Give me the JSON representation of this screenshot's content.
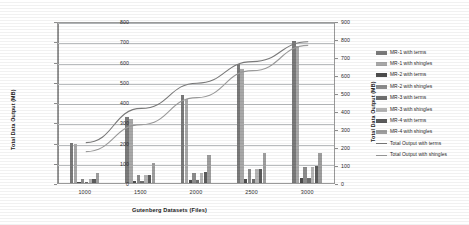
{
  "chart_data": {
    "type": "bar",
    "title": "",
    "xlabel": "Gutenberg Datasets (Files)",
    "ylabel": "Total Data Output (MB)",
    "ylabel_secondary": "Total Data Output (MB)",
    "categories": [
      "1000",
      "1500",
      "2000",
      "2500",
      "3000"
    ],
    "ylim": [
      0,
      800
    ],
    "yticks": [
      "0",
      "100",
      "200",
      "300",
      "400",
      "500",
      "600",
      "700",
      "800"
    ],
    "ylim_secondary": [
      0,
      900
    ],
    "yticks_secondary": [
      "0",
      "100",
      "200",
      "300",
      "400",
      "500",
      "600",
      "700",
      "800",
      "900"
    ],
    "grid": true,
    "legend_position": "right",
    "series": [
      {
        "name": "MR-1 with terms",
        "type": "bar",
        "axis": "primary",
        "color": "#7a7a7a",
        "values": [
          200,
          330,
          440,
          595,
          710
        ]
      },
      {
        "name": "MR-1 with shingles",
        "type": "bar",
        "axis": "primary",
        "color": "#a8a8a8",
        "values": [
          196,
          318,
          420,
          570,
          685
        ]
      },
      {
        "name": "MR-2 with terms",
        "type": "bar",
        "axis": "primary",
        "color": "#4d4d4d",
        "values": [
          4,
          8,
          14,
          20,
          26
        ]
      },
      {
        "name": "MR-2 with shingles",
        "type": "bar",
        "axis": "primary",
        "color": "#8c8c8c",
        "values": [
          18,
          38,
          52,
          68,
          82
        ]
      },
      {
        "name": "MR-3 with terms",
        "type": "bar",
        "axis": "primary",
        "color": "#6f6f6f",
        "values": [
          4,
          8,
          14,
          20,
          26
        ]
      },
      {
        "name": "MR-3 with shingles",
        "type": "bar",
        "axis": "primary",
        "color": "#b5b5b5",
        "values": [
          18,
          38,
          52,
          68,
          82
        ]
      },
      {
        "name": "MR-4 with terms",
        "type": "bar",
        "axis": "primary",
        "color": "#5c5c5c",
        "values": [
          20,
          40,
          55,
          72,
          86
        ]
      },
      {
        "name": "MR-4 with shingles",
        "type": "bar",
        "axis": "primary",
        "color": "#9e9e9e",
        "values": [
          50,
          100,
          140,
          150,
          148
        ]
      },
      {
        "name": "Total Output with terms",
        "type": "line",
        "axis": "secondary",
        "color": "#7b7b7b",
        "values": [
          230,
          420,
          560,
          680,
          790
        ]
      },
      {
        "name": "Total Output with shingles",
        "type": "line",
        "axis": "secondary",
        "color": "#9c9c9c",
        "values": [
          180,
          330,
          480,
          630,
          770
        ]
      }
    ]
  },
  "axes": {
    "x_title": "Gutenberg Datasets (Files)",
    "y_title_left": "Total Data Output (MB)",
    "y_title_right": "Total Data Output (MB)"
  }
}
